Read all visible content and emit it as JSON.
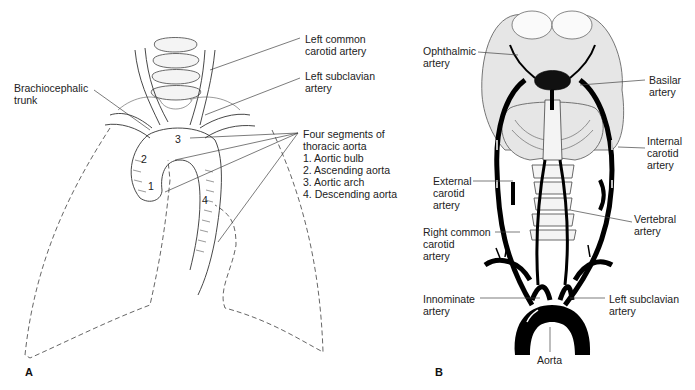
{
  "figure": {
    "panel_a": {
      "letter": "A",
      "labels": {
        "left_common_carotid": "Left common\ncarotid artery",
        "left_subclavian": "Left subclavian\nartery",
        "brachiocephalic": "Brachiocephalic\ntrunk",
        "segments_title": "Four segments of\nthoracic aorta",
        "segments": [
          "1. Aortic bulb",
          "2. Ascending aorta",
          "3. Aortic arch",
          "4. Descending aorta"
        ],
        "numbers": [
          "1",
          "2",
          "3",
          "4"
        ]
      }
    },
    "panel_b": {
      "letter": "B",
      "labels": {
        "ophthalmic": "Ophthalmic\nartery",
        "basilar": "Basilar\nartery",
        "internal_carotid": "Internal\ncarotid\nartery",
        "external_carotid": "External\ncarotid\nartery",
        "vertebral": "Vertebral\nartery",
        "right_common_carotid": "Right common\ncarotid\nartery",
        "innominate": "Innominate\nartery",
        "left_subclavian": "Left subclavian\nartery",
        "aorta": "Aorta"
      }
    }
  }
}
